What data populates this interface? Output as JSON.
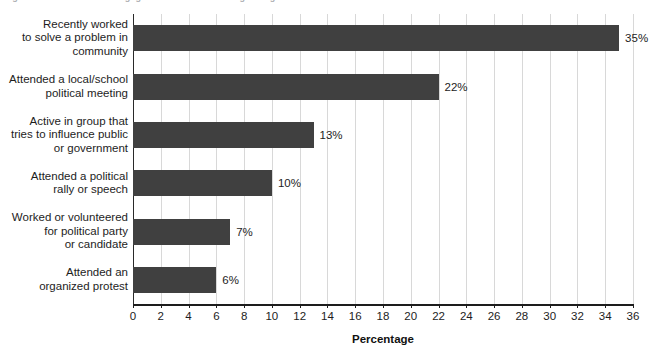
{
  "title_fragment": "Figure 12.4  Recent Civic Engagement Activities Among Young Adults",
  "chart_data": {
    "type": "bar",
    "orientation": "horizontal",
    "title": "",
    "xlabel": "Percentage",
    "ylabel": "",
    "xlim": [
      0,
      36
    ],
    "xticks": [
      0,
      2,
      4,
      6,
      8,
      10,
      12,
      14,
      16,
      18,
      20,
      22,
      24,
      26,
      28,
      30,
      32,
      34,
      36
    ],
    "grid": "vertical",
    "legend": "none",
    "bar_color": "#404040",
    "gridline_color": "#d8d8d8",
    "categories": [
      "Recently worked to solve a problem in community",
      "Attended a local/school political meeting",
      "Active in group that tries to influence public or government",
      "Attended a political rally or speech",
      "Worked or volunteered for political party or candidate",
      "Attended an organized protest"
    ],
    "values": [
      35,
      22,
      13,
      10,
      7,
      6
    ],
    "data_labels": [
      "35%",
      "22%",
      "13%",
      "10%",
      "7%",
      "6%"
    ]
  },
  "category_label_lines": [
    [
      "Recently worked",
      "to solve a problem in",
      "community"
    ],
    [
      "Attended a local/school",
      "political meeting"
    ],
    [
      "Active in group that",
      "tries to influence public",
      "or government"
    ],
    [
      "Attended a political",
      "rally or speech"
    ],
    [
      "Worked or volunteered",
      "for political party",
      "or candidate"
    ],
    [
      "Attended an",
      "organized protest"
    ]
  ]
}
